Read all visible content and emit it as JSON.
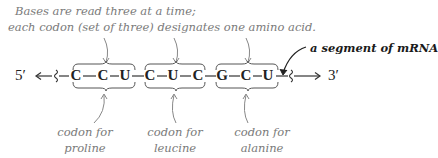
{
  "caption": {
    "line1": "Bases are read three at a time;",
    "line2": "each codon (set of three) designates one amino acid."
  },
  "segment_label": "a segment of mRNA",
  "ends": {
    "five_prime": "5′",
    "three_prime": "3′"
  },
  "sequence": [
    "C",
    "C",
    "U",
    "C",
    "U",
    "C",
    "G",
    "C",
    "U"
  ],
  "codons": [
    {
      "bases": "CCU",
      "label_line1": "codon for",
      "label_line2": "proline"
    },
    {
      "bases": "CUC",
      "label_line1": "codon for",
      "label_line2": "leucine"
    },
    {
      "bases": "GCU",
      "label_line1": "codon for",
      "label_line2": "alanine"
    }
  ],
  "colors": {
    "text": "#222222",
    "annotation": "#7a7a7a",
    "lines": "#555555"
  }
}
